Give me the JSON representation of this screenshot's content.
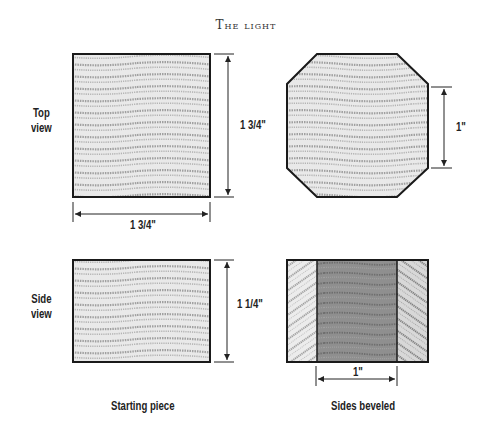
{
  "title": "The light",
  "row_labels": {
    "top": [
      "Top",
      "view"
    ],
    "side": [
      "Side",
      "view"
    ]
  },
  "dimensions": {
    "top_height": "1 3/4\"",
    "top_width": "1 3/4\"",
    "octagon_side": "1\"",
    "side_height": "1 1/4\"",
    "beveled_width": "1\""
  },
  "captions": {
    "left": "Starting piece",
    "right": "Sides beveled"
  },
  "colors": {
    "outline": "#1a1a1a",
    "wood_light": "#e6e6e6",
    "wood_grain": "#9a9a9a",
    "wood_dark": "#8c8c8c"
  }
}
